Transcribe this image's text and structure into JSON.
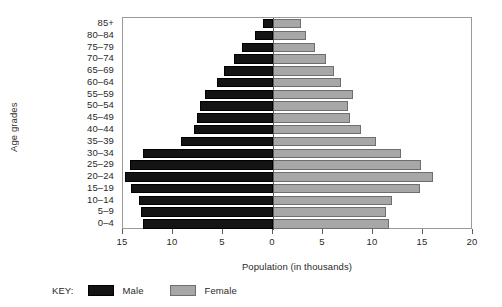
{
  "chart_data": {
    "type": "bar",
    "subtype": "population-pyramid",
    "title": "",
    "xlabel": "Population (in thousands)",
    "ylabel": "Age grades",
    "categories": [
      "85+",
      "80–84",
      "75–79",
      "70–74",
      "65–69",
      "60–64",
      "55–59",
      "50–54",
      "45–49",
      "40–44",
      "35–39",
      "30–34",
      "25–29",
      "20–24",
      "15–19",
      "10–14",
      "5–9",
      "0–4"
    ],
    "series": [
      {
        "name": "Male",
        "side": "left",
        "color": "#141414",
        "values": [
          1.0,
          1.8,
          3.1,
          3.9,
          4.9,
          5.6,
          6.8,
          7.3,
          7.6,
          7.9,
          9.2,
          13.0,
          14.3,
          14.8,
          14.2,
          13.4,
          13.2,
          13.0
        ]
      },
      {
        "name": "Female",
        "side": "right",
        "color": "#a7a7a7",
        "values": [
          2.8,
          3.3,
          4.2,
          5.3,
          6.1,
          6.8,
          8.0,
          7.5,
          7.7,
          8.8,
          10.3,
          12.8,
          14.8,
          16.0,
          14.7,
          11.9,
          11.3,
          11.6
        ]
      }
    ],
    "x_ticks": [
      {
        "label": "15",
        "value": -15
      },
      {
        "label": "10",
        "value": -10
      },
      {
        "label": "5",
        "value": -5
      },
      {
        "label": "0",
        "value": 0
      },
      {
        "label": "5",
        "value": 5
      },
      {
        "label": "10",
        "value": 10
      },
      {
        "label": "15",
        "value": 15
      },
      {
        "label": "20",
        "value": 20
      }
    ],
    "xlim": [
      -15,
      20
    ],
    "grid": false,
    "legend_position": "bottom-left"
  },
  "legend": {
    "title": "KEY:",
    "entries": [
      {
        "label": "Male",
        "color": "#141414"
      },
      {
        "label": "Female",
        "color": "#a7a7a7"
      }
    ]
  }
}
